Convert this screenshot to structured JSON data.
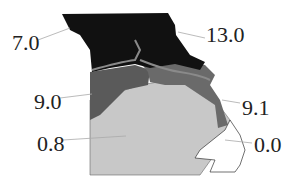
{
  "title": "",
  "regions": [
    {
      "name": "north",
      "value": "7.0",
      "color": "#111111"
    },
    {
      "name": "northeast",
      "value": "13.0",
      "color": "#111111"
    },
    {
      "name": "central-west",
      "value": "9.0",
      "color": "#5a5a5a"
    },
    {
      "name": "central-east",
      "value": "9.1",
      "color": "#6a6a6a"
    },
    {
      "name": "south",
      "value": "0.8",
      "color": "#c8c8c8"
    },
    {
      "name": "bootheel",
      "value": "0.0",
      "color": "#ffffff"
    }
  ],
  "labels": {
    "l1": "7.0",
    "l2": "13.0",
    "l3": "9.0",
    "l4": "9.1",
    "l5": "0.8",
    "l6": "0.0"
  }
}
